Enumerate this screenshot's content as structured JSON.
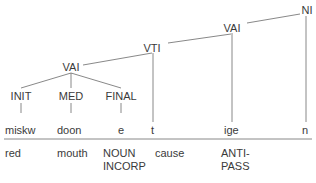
{
  "tree": {
    "nodes": [
      {
        "id": "ni",
        "label": "NI",
        "x": 307,
        "y": 4
      },
      {
        "id": "vai2",
        "label": "VAI",
        "x": 232,
        "y": 22
      },
      {
        "id": "vti",
        "label": "VTI",
        "x": 152,
        "y": 40
      },
      {
        "id": "vai1",
        "label": "VAI",
        "x": 71,
        "y": 61
      },
      {
        "id": "init",
        "label": "INIT",
        "x": 21,
        "y": 90
      },
      {
        "id": "med",
        "label": "MED",
        "x": 71,
        "y": 90
      },
      {
        "id": "final",
        "label": "FINAL",
        "x": 121,
        "y": 90
      }
    ]
  },
  "morphemes": [
    {
      "text": "miskw",
      "x": 5
    },
    {
      "text": "doon",
      "x": 57
    },
    {
      "text": "e",
      "x": 118
    },
    {
      "text": "t",
      "x": 151
    },
    {
      "text": "ige",
      "x": 223
    },
    {
      "text": "n",
      "x": 302
    }
  ],
  "glosses": [
    {
      "line1": "red",
      "line2": "",
      "x": 5
    },
    {
      "line1": "mouth",
      "line2": "",
      "x": 57
    },
    {
      "line1": "NOUN",
      "line2": "INCORP",
      "x": 103
    },
    {
      "line1": "cause",
      "line2": "",
      "x": 155
    },
    {
      "line1": "ANTI-",
      "line2": "PASS",
      "x": 220
    }
  ],
  "colors": {
    "line": "#6a6a6a",
    "text": "#3a3a3a"
  }
}
